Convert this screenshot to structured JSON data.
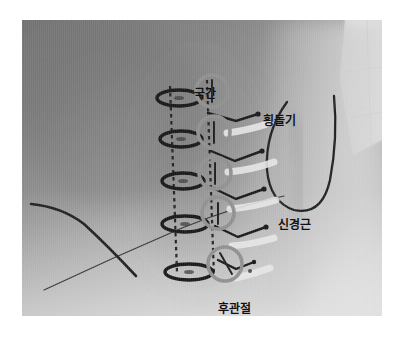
{
  "image": {
    "type": "photograph",
    "subject": "human back and neck with anatomical landmarks drawn in marker",
    "border_color": "#ffffff",
    "skin_tone_mid": "#8d8d8d",
    "skin_tone_light": "#c9c9c9",
    "skin_tone_dark": "#6d6d6d",
    "marker_dark_color": "#1a1a1a",
    "marker_gray_color": "#9a9a9a",
    "marker_light_color": "#e4e4e4"
  },
  "annotations": {
    "interspinous": {
      "label": "극간",
      "x": 172,
      "y": 68
    },
    "transverse_process": {
      "label": "횡돌기",
      "x": 241,
      "y": 95
    },
    "nerve_root": {
      "label": "신경근",
      "x": 256,
      "y": 199
    },
    "facet_joint": {
      "label": "후관절",
      "x": 196,
      "y": 283
    }
  },
  "markings": {
    "interspinous_ellipses_count": 5,
    "facet_circles_count": 5,
    "transverse_chevrons_count": 4,
    "nerve_strokes_count": 5,
    "dashed_guide_lines_count": 2,
    "skin_contour_lines_count": 3
  }
}
